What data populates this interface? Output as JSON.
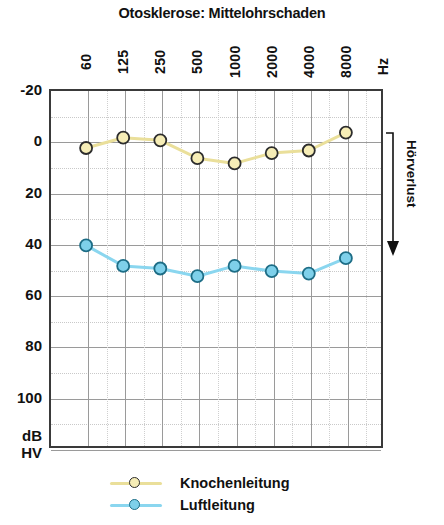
{
  "chart_data": {
    "type": "line",
    "title": "Otosklerose: Mittelohrschaden",
    "xlabel": "Hz",
    "ylabel": "dB HV",
    "x_unit": "Hz",
    "y_unit_line1": "dB",
    "y_unit_line2": "HV",
    "categories": [
      "60",
      "125",
      "250",
      "500",
      "1000",
      "2000",
      "4000",
      "8000"
    ],
    "x_tick_labels": [
      "60",
      "125",
      "250",
      "500",
      "1000",
      "2000",
      "4000",
      "8000"
    ],
    "y_tick_labels": [
      "-20",
      "0",
      "20",
      "40",
      "60",
      "80",
      "100"
    ],
    "y_ticks": [
      -20,
      0,
      20,
      40,
      60,
      80,
      100
    ],
    "ylim": [
      -20,
      120
    ],
    "y_inverted": true,
    "grid": true,
    "minor_grid": true,
    "legend_position": "bottom-left",
    "annotation": {
      "text": "Hörverlust",
      "arrow": "down",
      "position": "right"
    },
    "series": [
      {
        "name": "Knochenleitung",
        "color": "#eadf9a",
        "marker_fill": "#f6edb6",
        "marker_edge": "#2c2c2c",
        "values": [
          3,
          -1,
          0,
          7,
          9,
          5,
          4,
          -3
        ]
      },
      {
        "name": "Luftleitung",
        "color": "#8ad6ef",
        "marker_fill": "#7ed0ea",
        "marker_edge": "#1d6d86",
        "values": [
          41,
          49,
          50,
          53,
          49,
          51,
          52,
          46
        ]
      }
    ]
  },
  "legend": {
    "items": [
      {
        "label": "Knochenleitung"
      },
      {
        "label": "Luftleitung"
      }
    ]
  }
}
